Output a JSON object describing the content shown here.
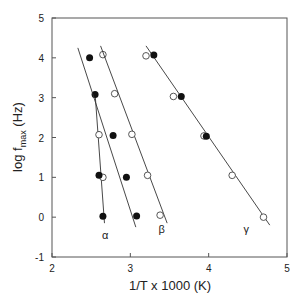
{
  "chart_data": {
    "type": "scatter",
    "title": "",
    "xlabel": "1/T x 1000    (K)",
    "ylabel": "log f_max   (Hz)",
    "xlim": [
      2,
      5
    ],
    "ylim": [
      -1,
      5
    ],
    "xticks": [
      "2",
      "3",
      "4",
      "5"
    ],
    "yticks": [
      "-1",
      "0",
      "1",
      "2",
      "3",
      "4",
      "5"
    ],
    "series": [
      {
        "name": "alpha",
        "label": "α",
        "filled": [
          [
            2.48,
            4.0
          ],
          [
            2.55,
            3.08
          ],
          [
            2.6,
            1.05
          ],
          [
            2.65,
            0.02
          ]
        ],
        "open": [
          [
            2.6,
            2.07
          ],
          [
            2.65,
            1.0
          ]
        ],
        "line": [
          [
            2.55,
            3.1
          ],
          [
            2.67,
            -0.15
          ]
        ]
      },
      {
        "name": "beta-left",
        "label": "",
        "filled": [
          [
            2.78,
            2.05
          ],
          [
            2.95,
            1.0
          ],
          [
            3.08,
            0.03
          ]
        ],
        "open": [
          [
            2.65,
            4.08
          ],
          [
            2.8,
            3.1
          ]
        ],
        "line": [
          [
            2.33,
            4.25
          ],
          [
            3.07,
            -0.25
          ]
        ]
      },
      {
        "name": "beta",
        "label": "β",
        "filled": [],
        "open": [
          [
            3.02,
            2.08
          ],
          [
            3.22,
            1.05
          ],
          [
            3.38,
            0.05
          ]
        ],
        "line": [
          [
            2.62,
            4.3
          ],
          [
            3.47,
            -0.15
          ]
        ]
      },
      {
        "name": "gamma",
        "label": "γ",
        "filled": [
          [
            3.3,
            4.07
          ],
          [
            3.65,
            3.03
          ],
          [
            3.97,
            2.03
          ]
        ],
        "open": [
          [
            3.2,
            4.05
          ],
          [
            3.55,
            3.03
          ],
          [
            3.94,
            2.04
          ],
          [
            4.3,
            1.05
          ],
          [
            4.7,
            0.0
          ]
        ],
        "line": [
          [
            3.2,
            4.3
          ],
          [
            4.78,
            -0.2
          ]
        ]
      }
    ],
    "annotations": [
      {
        "text": "α",
        "x": 2.68,
        "y": -0.45
      },
      {
        "text": "β",
        "x": 3.4,
        "y": -0.3
      },
      {
        "text": "γ",
        "x": 4.48,
        "y": -0.3
      }
    ]
  }
}
